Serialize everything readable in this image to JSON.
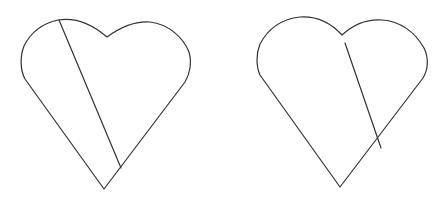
{
  "figure": {
    "width": 447,
    "height": 201,
    "background": "#ffffff",
    "stroke_color": "#333333",
    "panels": [
      {
        "name": "left-heart",
        "outline_path": "M 104 189 L 25 79 C 20 70 20 56 24 46 C 32 30 44 23 58 20 C 75 17 92 24 107 37 C 122 26 136 21 150 22 C 168 24 183 37 189 52 C 192 62 190 74 185 82 Z",
        "line": {
          "x1": 59,
          "y1": 20,
          "x2": 121,
          "y2": 168,
          "description": "chord crossing heart from top-left lobe to lower-right edge"
        }
      },
      {
        "name": "right-heart",
        "outline_path": "M 340 187 L 260 75 C 256 66 256 54 260 44 C 268 29 282 19 300 17 C 315 16 330 22 342 35 C 355 23 368 19 382 20 C 400 21 415 32 424 48 C 429 58 428 70 423 78 Z",
        "line": {
          "x1": 345,
          "y1": 43,
          "x2": 381,
          "y2": 148,
          "description": "segment starting inside right lobe and crossing lower-right edge"
        }
      }
    ]
  }
}
